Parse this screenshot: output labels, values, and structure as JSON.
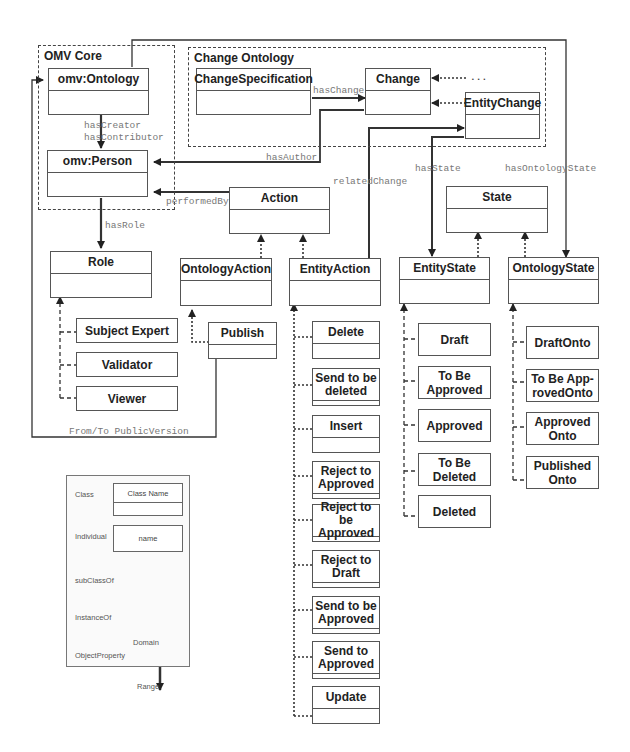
{
  "packages": {
    "omv_core": "OMV Core",
    "change_ontology": "Change Ontology"
  },
  "classes": {
    "omv_ontology": "omv:Ontology",
    "omv_person": "omv:Person",
    "change_specification": "ChangeSpecification",
    "change": "Change",
    "entity_change": "EntityChange",
    "action": "Action",
    "role": "Role",
    "ontology_action": "OntologyAction",
    "entity_action": "EntityAction",
    "state": "State",
    "entity_state": "EntityState",
    "ontology_state": "OntologyState",
    "ellipsis": "..."
  },
  "roles": [
    "Subject Expert",
    "Validator",
    "Viewer"
  ],
  "ontology_actions": [
    "Publish"
  ],
  "entity_actions": [
    "Delete",
    "Send to be deleted",
    "Insert",
    "Reject to Approved",
    "Reject to be Approved",
    "Reject to Draft",
    "Send to be Approved",
    "Send to Approved",
    "Update"
  ],
  "entity_states": [
    "Draft",
    "To Be Approved",
    "Approved",
    "To Be Deleted",
    "Deleted"
  ],
  "ontology_states": [
    "DraftOnto",
    "To Be App-rovedOnto",
    "Approved Onto",
    "Published Onto"
  ],
  "relations": {
    "has_creator": "hasCreator",
    "has_contributor": "hasContributor",
    "has_change": "hasChange",
    "has_author": "hasAuthor",
    "performed_by": "performedBy",
    "related_change": "relatedChange",
    "has_state": "hasState",
    "has_ontology_state": "hasOntologyState",
    "has_role": "hasRole",
    "from_to_public_version": "From/To PublicVersion"
  },
  "legend": {
    "class_label": "Class",
    "class_name": "Class Name",
    "individual_label": "Individual",
    "individual_name": "name",
    "subclassof_label": "subClassOf",
    "instanceof_label": "InstanceOf",
    "objectproperty_label": "ObjectProperty",
    "domain_label": "Domain",
    "range_label": "Range"
  }
}
